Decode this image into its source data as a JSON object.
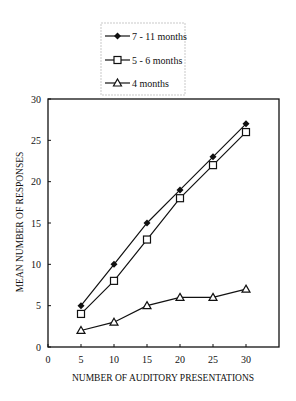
{
  "chart_data": {
    "type": "line",
    "title": "",
    "xlabel": "NUMBER OF AUDITORY PRESENTATIONS",
    "ylabel": "MEAN NUMBER OF RESPONSES",
    "x": [
      5,
      10,
      15,
      20,
      25,
      30
    ],
    "x_ticks": [
      0,
      5,
      10,
      15,
      20,
      25,
      30
    ],
    "y_ticks": [
      0,
      5,
      10,
      15,
      20,
      25,
      30
    ],
    "xlim": [
      0,
      35
    ],
    "ylim": [
      0,
      30
    ],
    "grid": false,
    "legend_position": "top-center-outside",
    "series": [
      {
        "name": "7 - 11 months",
        "marker": "filled-diamond",
        "values": [
          5,
          10,
          15,
          19,
          23,
          27
        ]
      },
      {
        "name": "5 - 6 months",
        "marker": "open-square",
        "values": [
          4,
          8,
          13,
          18,
          22,
          26
        ]
      },
      {
        "name": "4 months",
        "marker": "open-triangle",
        "values": [
          2,
          3,
          5,
          6,
          6,
          7
        ]
      }
    ]
  },
  "legend": {
    "items": [
      {
        "label": "7 - 11 months"
      },
      {
        "label": "5 - 6 months"
      },
      {
        "label": "4 months"
      }
    ]
  },
  "axes": {
    "xlabel": "NUMBER OF AUDITORY PRESENTATIONS",
    "ylabel": "MEAN NUMBER OF RESPONSES",
    "x_tick_labels": [
      "0",
      "5",
      "10",
      "15",
      "20",
      "25",
      "30"
    ],
    "y_tick_labels": [
      "0",
      "5",
      "10",
      "15",
      "20",
      "25",
      "30"
    ]
  }
}
